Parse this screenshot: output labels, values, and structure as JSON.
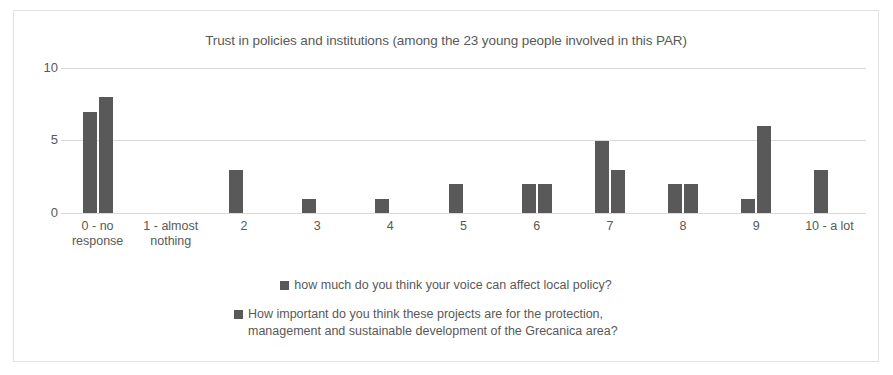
{
  "chart_data": {
    "type": "bar",
    "title": "Trust in policies and institutions (among the 23 young people involved in this PAR)",
    "xlabel": "",
    "ylabel": "",
    "ylim": [
      0,
      10
    ],
    "yticks": [
      "0",
      "5",
      "10"
    ],
    "grid": true,
    "legend_position": "bottom",
    "categories": [
      "0 - no response",
      "1 - almost nothing",
      "2",
      "3",
      "4",
      "5",
      "6",
      "7",
      "8",
      "9",
      "10 - a lot"
    ],
    "series": [
      {
        "name": "how much do you think your voice can affect local policy?",
        "color": "#595959",
        "values": [
          7,
          0,
          3,
          1,
          1,
          2,
          2,
          5,
          2,
          1,
          3
        ]
      },
      {
        "name": "How important do you think these projects are for the protection, management and sustainable development of the Grecanica area?",
        "color": "#595959",
        "values": [
          8,
          0,
          0,
          0,
          0,
          0,
          2,
          3,
          2,
          6,
          0
        ]
      }
    ]
  },
  "legend": {
    "entries": [
      "how much do you think your voice can affect local policy?",
      "How important do you think these projects are for the protection, management and sustainable development of the Grecanica area?"
    ]
  }
}
